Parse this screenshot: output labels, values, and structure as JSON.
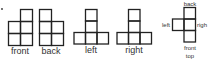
{
  "diagram": {
    "stroke_color": "#222222",
    "text_color": "#333333",
    "views": [
      {
        "name": "front",
        "label": "front",
        "cells": [
          [
            1,
            0
          ],
          [
            0,
            1
          ],
          [
            1,
            1
          ],
          [
            0,
            2
          ],
          [
            1,
            2
          ]
        ]
      },
      {
        "name": "back",
        "label": "back",
        "cells": [
          [
            0,
            0
          ],
          [
            0,
            1
          ],
          [
            1,
            1
          ],
          [
            0,
            2
          ],
          [
            1,
            2
          ]
        ]
      },
      {
        "name": "left",
        "label": "left",
        "cells": [
          [
            1,
            0
          ],
          [
            1,
            1
          ],
          [
            0,
            2
          ],
          [
            1,
            2
          ],
          [
            2,
            2
          ]
        ]
      },
      {
        "name": "right",
        "label": "right",
        "cells": [
          [
            1,
            0
          ],
          [
            1,
            1
          ],
          [
            0,
            2
          ],
          [
            1,
            2
          ],
          [
            2,
            2
          ]
        ]
      },
      {
        "name": "top",
        "label": "top",
        "cells": [
          [
            1,
            0
          ],
          [
            0,
            1
          ],
          [
            1,
            1
          ],
          [
            1,
            2
          ]
        ],
        "direction_labels": {
          "back": "back",
          "left": "left",
          "right": "righ",
          "front": "front"
        }
      }
    ]
  }
}
